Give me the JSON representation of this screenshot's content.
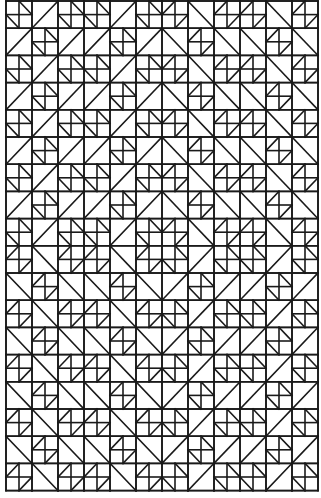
{
  "pattern": {
    "name": "quilt-line-drawing",
    "stroke_color": "#1a1a1a",
    "background": "#ffffff",
    "origin": [
      6,
      1
    ],
    "cell_width": 26,
    "cell_height": 27.2,
    "columns": 12,
    "rows": 18,
    "legend": {
      "q\\": "four-patch with small diagonals '\\' in top-right and bottom-left quadrants",
      "q/": "four-patch with small diagonals '/' in top-left and bottom-right quadrants",
      "/": "half-square triangle, diagonal bottom-left to top-right",
      "\\": "half-square triangle, diagonal top-left to bottom-right"
    },
    "grid": [
      [
        "q\\",
        "/",
        "q\\",
        "q\\",
        "/",
        "q\\",
        "q/",
        "\\",
        "q/",
        "q/",
        "\\",
        "q/"
      ],
      [
        "/",
        "q\\",
        "/",
        "/",
        "q\\",
        "/",
        "\\",
        "q/",
        "\\",
        "\\",
        "q/",
        "\\"
      ],
      [
        "q\\",
        "/",
        "q\\",
        "q\\",
        "/",
        "q\\",
        "q/",
        "\\",
        "q/",
        "q/",
        "\\",
        "q/"
      ],
      [
        "/",
        "q\\",
        "/",
        "/",
        "q\\",
        "/",
        "\\",
        "q/",
        "\\",
        "\\",
        "q/",
        "\\"
      ],
      [
        "q\\",
        "/",
        "q\\",
        "q\\",
        "/",
        "q\\",
        "q/",
        "\\",
        "q/",
        "q/",
        "\\",
        "q/"
      ],
      [
        "/",
        "q\\",
        "/",
        "/",
        "q\\",
        "/",
        "\\",
        "q/",
        "\\",
        "\\",
        "q/",
        "\\"
      ],
      [
        "q\\",
        "/",
        "q\\",
        "q\\",
        "/",
        "q\\",
        "q/",
        "\\",
        "q/",
        "q/",
        "\\",
        "q/"
      ],
      [
        "/",
        "q\\",
        "/",
        "/",
        "q\\",
        "/",
        "\\",
        "q/",
        "\\",
        "\\",
        "q/",
        "\\"
      ],
      [
        "q\\",
        "/",
        "q\\",
        "q\\",
        "/",
        "q\\",
        "q/",
        "\\",
        "q/",
        "q/",
        "\\",
        "q/"
      ],
      [
        "q/",
        "\\",
        "q/",
        "q/",
        "\\",
        "q/",
        "q\\",
        "/",
        "q\\",
        "q\\",
        "/",
        "q\\"
      ],
      [
        "\\",
        "q/",
        "\\",
        "\\",
        "q/",
        "\\",
        "/",
        "q\\",
        "/",
        "/",
        "q\\",
        "/"
      ],
      [
        "q/",
        "\\",
        "q/",
        "q/",
        "\\",
        "q/",
        "q\\",
        "/",
        "q\\",
        "q\\",
        "/",
        "q\\"
      ],
      [
        "\\",
        "q/",
        "\\",
        "\\",
        "q/",
        "\\",
        "/",
        "q\\",
        "/",
        "/",
        "q\\",
        "/"
      ],
      [
        "q/",
        "\\",
        "q/",
        "q/",
        "\\",
        "q/",
        "q\\",
        "/",
        "q\\",
        "q\\",
        "/",
        "q\\"
      ],
      [
        "\\",
        "q/",
        "\\",
        "\\",
        "q/",
        "\\",
        "/",
        "q\\",
        "/",
        "/",
        "q\\",
        "/"
      ],
      [
        "q/",
        "\\",
        "q/",
        "q/",
        "\\",
        "q/",
        "q\\",
        "/",
        "q\\",
        "q\\",
        "/",
        "q\\"
      ],
      [
        "\\",
        "q/",
        "\\",
        "\\",
        "q/",
        "\\",
        "/",
        "q\\",
        "/",
        "/",
        "q\\",
        "/"
      ],
      [
        "q/",
        "\\",
        "q/",
        "q/",
        "\\",
        "q/",
        "q\\",
        "/",
        "q\\",
        "q\\",
        "/",
        "q\\"
      ]
    ]
  }
}
